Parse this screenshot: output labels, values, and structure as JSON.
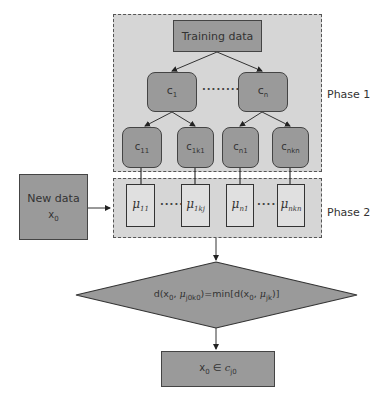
{
  "phase1": {
    "label": "Phase 1",
    "training": "Training data",
    "clusters": [
      {
        "base": "c",
        "sub": "1"
      },
      {
        "base": "c",
        "sub": "n"
      }
    ],
    "cluster_dots": "·········",
    "subclusters": [
      {
        "base": "c",
        "sub": "11"
      },
      {
        "base": "c",
        "sub": "1k1"
      },
      {
        "base": "c",
        "sub": "n1"
      },
      {
        "base": "c",
        "sub": "nkn"
      }
    ]
  },
  "phase2": {
    "label": "Phase 2",
    "centroids": [
      {
        "base": "μ",
        "sub": "11"
      },
      {
        "base": "μ",
        "sub": "1kj"
      },
      {
        "base": "μ",
        "sub": "n1"
      },
      {
        "base": "μ",
        "sub": "nkn"
      }
    ],
    "dots": "·····"
  },
  "new_data": {
    "title": "New data",
    "var_base": "x",
    "var_sub": "0"
  },
  "decision": {
    "text_prefix": "d(x",
    "x_sub": "0",
    "mid1": ", ",
    "mu": "μ",
    "mu_sub1": "j0k0",
    "mid2": ")=min[d(x",
    "x_sub2": "0",
    "mid3": ", ",
    "mu_sub2": "jk",
    "suffix": ")]"
  },
  "result": {
    "x": "x",
    "x_sub": "0",
    "elem": " ∈ ",
    "c": "c",
    "c_sub": "j0"
  }
}
